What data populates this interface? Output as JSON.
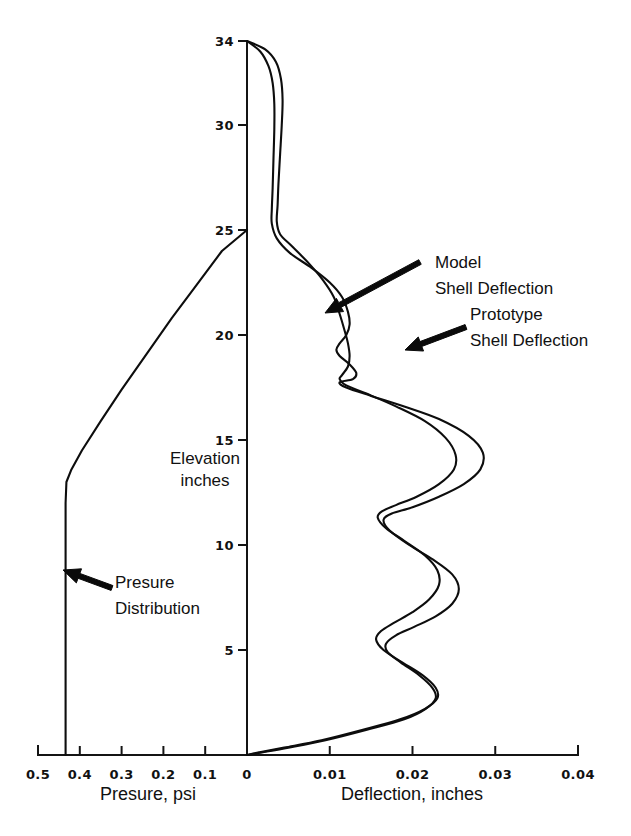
{
  "chart_data": {
    "type": "line",
    "title": "",
    "orientation": "horizontal-value-vertical-elevation",
    "grid": false,
    "legend_position": "inline-annotations",
    "ylabel_line1": "Elevation",
    "ylabel_line2": "inches",
    "ylim": [
      0,
      34
    ],
    "yticks": [
      5,
      10,
      15,
      20,
      25,
      30,
      34
    ],
    "ytick_labels": [
      "5",
      "10",
      "15",
      "20",
      "25",
      "30",
      "34"
    ],
    "bottom_axis_left": {
      "label": "Presure, psi",
      "xlim": [
        0.5,
        0.0
      ],
      "ticks": [
        0.5,
        0.4,
        0.3,
        0.2,
        0.1,
        0.0
      ],
      "tick_labels": [
        "0.5",
        "0.4",
        "0.3",
        "0.2",
        "0.1",
        "0"
      ],
      "direction": "right-to-left-decreasing"
    },
    "bottom_axis_right": {
      "label": "Deflection, inches",
      "xlim": [
        0.0,
        0.04
      ],
      "ticks": [
        0.0,
        0.01,
        0.02,
        0.03,
        0.04
      ],
      "tick_labels": [
        "0",
        "0.01",
        "0.02",
        "0.03",
        "0.04"
      ],
      "direction": "left-to-right-increasing"
    },
    "series": [
      {
        "name": "Model Shell Deflection",
        "axis": "deflection",
        "color": "#0d0d0d",
        "points": [
          [
            0.0,
            34.0
          ],
          [
            0.0022,
            33.6
          ],
          [
            0.0035,
            33.0
          ],
          [
            0.0041,
            32.2
          ],
          [
            0.0043,
            31.2
          ],
          [
            0.0042,
            30.0
          ],
          [
            0.004,
            28.6
          ],
          [
            0.0038,
            27.2
          ],
          [
            0.0037,
            26.2
          ],
          [
            0.0036,
            25.4
          ],
          [
            0.004,
            24.8
          ],
          [
            0.0055,
            24.2
          ],
          [
            0.0075,
            23.4
          ],
          [
            0.0092,
            22.6
          ],
          [
            0.0105,
            21.8
          ],
          [
            0.0112,
            21.0
          ],
          [
            0.0118,
            20.2
          ],
          [
            0.0122,
            19.6
          ],
          [
            0.0124,
            19.0
          ],
          [
            0.0122,
            18.5
          ],
          [
            0.0115,
            18.1
          ],
          [
            0.0112,
            17.9
          ],
          [
            0.012,
            17.6
          ],
          [
            0.0145,
            17.2
          ],
          [
            0.018,
            16.6
          ],
          [
            0.0215,
            15.9
          ],
          [
            0.024,
            15.1
          ],
          [
            0.0252,
            14.3
          ],
          [
            0.025,
            13.6
          ],
          [
            0.0232,
            12.9
          ],
          [
            0.0205,
            12.3
          ],
          [
            0.018,
            11.9
          ],
          [
            0.0163,
            11.6
          ],
          [
            0.0158,
            11.3
          ],
          [
            0.0168,
            10.8
          ],
          [
            0.019,
            10.2
          ],
          [
            0.0215,
            9.5
          ],
          [
            0.023,
            8.8
          ],
          [
            0.0232,
            8.1
          ],
          [
            0.022,
            7.4
          ],
          [
            0.02,
            6.8
          ],
          [
            0.0178,
            6.3
          ],
          [
            0.0162,
            5.9
          ],
          [
            0.0156,
            5.5
          ],
          [
            0.0165,
            5.0
          ],
          [
            0.0188,
            4.4
          ],
          [
            0.0212,
            3.8
          ],
          [
            0.0228,
            3.2
          ],
          [
            0.023,
            2.7
          ],
          [
            0.0215,
            2.2
          ],
          [
            0.0185,
            1.7
          ],
          [
            0.014,
            1.2
          ],
          [
            0.009,
            0.7
          ],
          [
            0.0045,
            0.35
          ],
          [
            0.0012,
            0.1
          ],
          [
            0.0,
            0.0
          ]
        ]
      },
      {
        "name": "Prototype Shell Deflection",
        "axis": "deflection",
        "color": "#0d0d0d",
        "points": [
          [
            0.0,
            34.0
          ],
          [
            0.0016,
            33.5
          ],
          [
            0.0026,
            32.8
          ],
          [
            0.0031,
            32.0
          ],
          [
            0.0033,
            31.0
          ],
          [
            0.0033,
            29.8
          ],
          [
            0.0032,
            28.4
          ],
          [
            0.0031,
            27.0
          ],
          [
            0.003,
            26.0
          ],
          [
            0.003,
            25.3
          ],
          [
            0.0036,
            24.6
          ],
          [
            0.0052,
            23.9
          ],
          [
            0.0078,
            23.2
          ],
          [
            0.01,
            22.5
          ],
          [
            0.0115,
            21.8
          ],
          [
            0.0122,
            21.1
          ],
          [
            0.0124,
            20.5
          ],
          [
            0.012,
            20.0
          ],
          [
            0.0112,
            19.6
          ],
          [
            0.0108,
            19.3
          ],
          [
            0.0112,
            19.0
          ],
          [
            0.0124,
            18.6
          ],
          [
            0.0132,
            18.2
          ],
          [
            0.0128,
            17.9
          ],
          [
            0.0112,
            17.75
          ],
          [
            0.012,
            17.5
          ],
          [
            0.015,
            17.1
          ],
          [
            0.019,
            16.6
          ],
          [
            0.0232,
            16.0
          ],
          [
            0.0268,
            15.2
          ],
          [
            0.0285,
            14.4
          ],
          [
            0.0282,
            13.6
          ],
          [
            0.0262,
            12.9
          ],
          [
            0.0232,
            12.3
          ],
          [
            0.02,
            11.8
          ],
          [
            0.0175,
            11.5
          ],
          [
            0.0165,
            11.2
          ],
          [
            0.0172,
            10.7
          ],
          [
            0.0196,
            10.0
          ],
          [
            0.0225,
            9.3
          ],
          [
            0.0248,
            8.6
          ],
          [
            0.0256,
            7.9
          ],
          [
            0.0248,
            7.2
          ],
          [
            0.0228,
            6.6
          ],
          [
            0.0202,
            6.1
          ],
          [
            0.018,
            5.7
          ],
          [
            0.0168,
            5.3
          ],
          [
            0.017,
            4.9
          ],
          [
            0.0186,
            4.4
          ],
          [
            0.0208,
            3.8
          ],
          [
            0.0224,
            3.2
          ],
          [
            0.0228,
            2.7
          ],
          [
            0.0216,
            2.2
          ],
          [
            0.019,
            1.7
          ],
          [
            0.0145,
            1.2
          ],
          [
            0.0095,
            0.7
          ],
          [
            0.005,
            0.35
          ],
          [
            0.0014,
            0.1
          ],
          [
            0.0,
            0.0
          ]
        ]
      },
      {
        "name": "Presure Distribution",
        "axis": "pressure",
        "color": "#0d0d0d",
        "points": [
          [
            0.0,
            25.0
          ],
          [
            0.06,
            24.0
          ],
          [
            0.12,
            22.4
          ],
          [
            0.18,
            20.8
          ],
          [
            0.24,
            19.1
          ],
          [
            0.3,
            17.4
          ],
          [
            0.35,
            15.9
          ],
          [
            0.395,
            14.5
          ],
          [
            0.42,
            13.6
          ],
          [
            0.432,
            13.0
          ],
          [
            0.434,
            12.0
          ],
          [
            0.434,
            9.0
          ],
          [
            0.434,
            6.0
          ],
          [
            0.434,
            3.0
          ],
          [
            0.434,
            0.0
          ]
        ]
      }
    ],
    "annotations": [
      {
        "id": "model-annotation",
        "line1": "Model",
        "line2": "Shell Deflection",
        "text_x": 435,
        "text_y": 268,
        "arrow_from": [
          420,
          262
        ],
        "arrow_to": [
          325,
          313
        ]
      },
      {
        "id": "prototype-annotation",
        "line1": "Prototype",
        "line2": "Shell Deflection",
        "text_x": 470,
        "text_y": 320,
        "arrow_from": [
          466,
          327
        ],
        "arrow_to": [
          405,
          350
        ]
      },
      {
        "id": "pressure-annotation",
        "line1": "Presure",
        "line2": "Distribution",
        "text_x": 115,
        "text_y": 588,
        "arrow_from": [
          112,
          588
        ],
        "arrow_to": [
          63,
          570
        ]
      }
    ]
  }
}
